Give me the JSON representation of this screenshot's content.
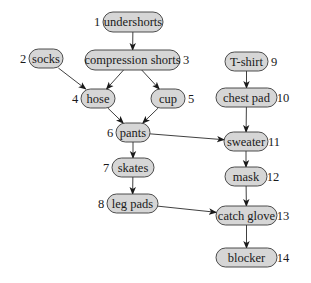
{
  "diagram": {
    "type": "directed-acyclic-graph",
    "colors": {
      "node_fill": "#d6d6d6",
      "node_stroke": "#3a3a3a",
      "edge": "#2a2a2a",
      "background": "#ffffff"
    },
    "nodes": [
      {
        "id": "undershorts",
        "label": "undershorts",
        "order": "1",
        "x": 103,
        "y": 12,
        "w": 60,
        "h": 20,
        "num_side": "left"
      },
      {
        "id": "socks",
        "label": "socks",
        "order": "2",
        "x": 29,
        "y": 49,
        "w": 34,
        "h": 19,
        "num_side": "left"
      },
      {
        "id": "compression",
        "label": "compression shorts",
        "order": "3",
        "x": 85,
        "y": 50,
        "w": 95,
        "h": 20,
        "num_side": "right"
      },
      {
        "id": "hose",
        "label": "hose",
        "order": "4",
        "x": 81,
        "y": 89,
        "w": 34,
        "h": 19,
        "num_side": "left"
      },
      {
        "id": "cup",
        "label": "cup",
        "order": "5",
        "x": 151,
        "y": 89,
        "w": 34,
        "h": 19,
        "num_side": "right"
      },
      {
        "id": "pants",
        "label": "pants",
        "order": "6",
        "x": 116,
        "y": 123,
        "w": 34,
        "h": 19,
        "num_side": "left"
      },
      {
        "id": "skates",
        "label": "skates",
        "order": "7",
        "x": 112,
        "y": 158,
        "w": 42,
        "h": 19,
        "num_side": "left"
      },
      {
        "id": "legpads",
        "label": "leg pads",
        "order": "8",
        "x": 107,
        "y": 194,
        "w": 51,
        "h": 19,
        "num_side": "left"
      },
      {
        "id": "tshirt",
        "label": "T-shirt",
        "order": "9",
        "x": 225,
        "y": 52,
        "w": 43,
        "h": 19,
        "num_side": "right"
      },
      {
        "id": "chestpad",
        "label": "chest pad",
        "order": "10",
        "x": 216,
        "y": 88,
        "w": 61,
        "h": 19,
        "num_side": "right"
      },
      {
        "id": "sweater",
        "label": "sweater",
        "order": "11",
        "x": 224,
        "y": 132,
        "w": 44,
        "h": 19,
        "num_side": "right"
      },
      {
        "id": "mask",
        "label": "mask",
        "order": "12",
        "x": 225,
        "y": 167,
        "w": 42,
        "h": 19,
        "num_side": "right"
      },
      {
        "id": "catchglove",
        "label": "catch glove",
        "order": "13",
        "x": 216,
        "y": 206,
        "w": 61,
        "h": 19,
        "num_side": "right"
      },
      {
        "id": "blocker",
        "label": "blocker",
        "order": "14",
        "x": 216,
        "y": 248,
        "w": 61,
        "h": 19,
        "num_side": "right"
      }
    ],
    "edges": [
      {
        "from": "undershorts",
        "to": "compression"
      },
      {
        "from": "socks",
        "to": "hose"
      },
      {
        "from": "compression",
        "to": "hose"
      },
      {
        "from": "compression",
        "to": "cup"
      },
      {
        "from": "hose",
        "to": "pants"
      },
      {
        "from": "cup",
        "to": "pants"
      },
      {
        "from": "pants",
        "to": "skates"
      },
      {
        "from": "pants",
        "to": "sweater"
      },
      {
        "from": "skates",
        "to": "legpads"
      },
      {
        "from": "legpads",
        "to": "catchglove"
      },
      {
        "from": "tshirt",
        "to": "chestpad"
      },
      {
        "from": "chestpad",
        "to": "sweater"
      },
      {
        "from": "sweater",
        "to": "mask"
      },
      {
        "from": "mask",
        "to": "catchglove"
      },
      {
        "from": "catchglove",
        "to": "blocker"
      }
    ]
  }
}
